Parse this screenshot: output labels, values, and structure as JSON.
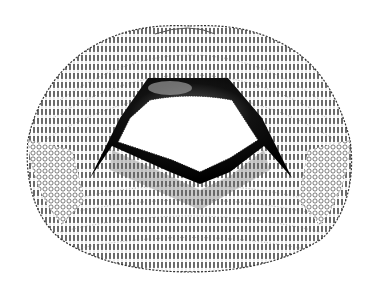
{
  "figure": {
    "colors": {
      "background": "#ffffff",
      "ink": "#111111",
      "stipple": "#555555"
    },
    "regions": [
      {
        "name": "outer-crenulated-margin"
      },
      {
        "name": "concentric-striae-rows"
      },
      {
        "name": "lateral-reticulate-areas"
      },
      {
        "name": "central-opening"
      },
      {
        "name": "upper-dark-rim"
      },
      {
        "name": "lower-dark-rim"
      }
    ]
  }
}
